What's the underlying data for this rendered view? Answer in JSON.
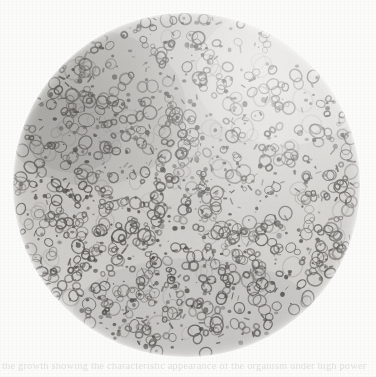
{
  "page": {
    "kind": "scanned-photomicrograph-plate",
    "width": 376,
    "height": 377,
    "paper_color": "#fbfbfa"
  },
  "figure": {
    "name": "circular-microscope-field",
    "field": {
      "shape": "circle",
      "center_x": 186,
      "center_y": 185,
      "radius_x": 173,
      "radius_y": 172,
      "background_color": "#d2d0cc",
      "edge_color": "#fbfbfa"
    },
    "texture": {
      "ring_color": "#565450",
      "dot_color": "#474541",
      "haze_color": "#8d8a85",
      "ring_count": 520,
      "dot_count": 760,
      "density": "dense",
      "darker_patch": "upper-left",
      "lighter_patch": "upper-right"
    }
  },
  "caption": {
    "ghost_text": "the growth showing the characteristic appearance of the organism under high power",
    "legible": false
  }
}
